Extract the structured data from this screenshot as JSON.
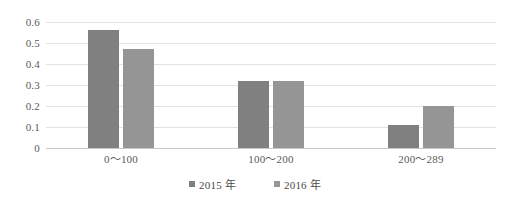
{
  "chart_data": {
    "type": "bar",
    "title": "",
    "subtitle": "",
    "xlabel": "",
    "ylabel": "",
    "categories": [
      "0～100",
      "100～200",
      "200～289"
    ],
    "series": [
      {
        "name": "2015 年",
        "values": [
          0.56,
          0.32,
          0.11
        ],
        "color": "#808080"
      },
      {
        "name": "2016 年",
        "values": [
          0.47,
          0.32,
          0.2
        ],
        "color": "#959595"
      }
    ],
    "ylim": [
      0,
      0.6
    ],
    "yticks": [
      0,
      0.1,
      0.2,
      0.3,
      0.4,
      0.5,
      0.6
    ],
    "ytick_labels": [
      "0",
      "0.1",
      "0.2",
      "0.3",
      "0.4",
      "0.5",
      "0.6"
    ],
    "grid": true,
    "grid_axis": "y",
    "legend_position": "bottom",
    "background_color": "#ffffff",
    "gridline_color": "#e2e2e2",
    "axis_color": "#c9c9c9",
    "text_color": "#5a5a5a"
  }
}
